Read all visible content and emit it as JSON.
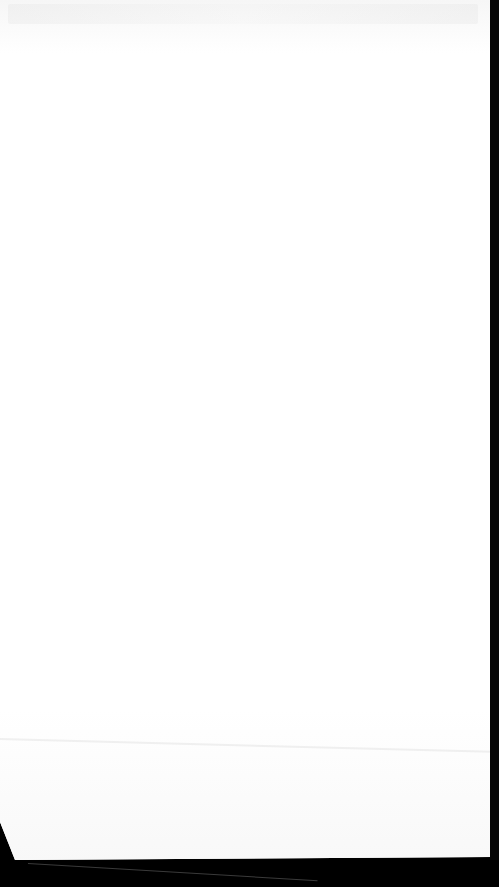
{
  "image": {
    "description": "Overexposed photo of a display screen; no legible content",
    "screen_color": "#fdfdfd",
    "bezel_color": "#000000"
  },
  "screen": {
    "header_text": "",
    "body_text": ""
  }
}
